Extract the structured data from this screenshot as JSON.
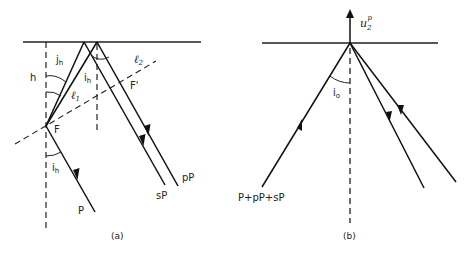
{
  "panel_a": {
    "caption": "(a)",
    "labels": {
      "jh_main": "j",
      "jh_sub": "h",
      "h": "h",
      "ih_top_main": "i",
      "ih_top_sub": "h",
      "l1_main": "ℓ",
      "l1_sub": "1",
      "l2_main": "ℓ",
      "l2_sub": "2",
      "F": "F",
      "F_prime": "F'",
      "ih_bottom_main": "i",
      "ih_bottom_sub": "h",
      "P": "P",
      "sP": "sP",
      "pP": "pP"
    }
  },
  "panel_b": {
    "caption": "(b)",
    "labels": {
      "u_main": "u",
      "u_sup": "p",
      "u_sub": "2",
      "io_main": "i",
      "io_sub": "o",
      "incoming": "P+pP+sP"
    }
  }
}
